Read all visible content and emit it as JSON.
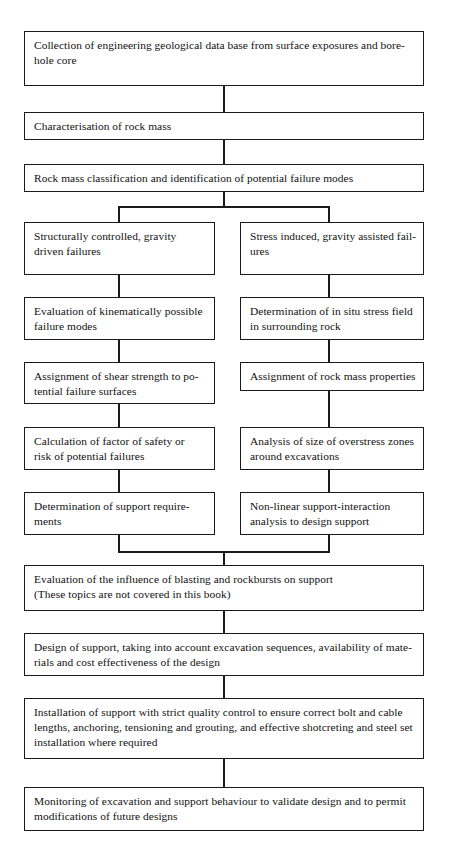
{
  "diagram": {
    "type": "flowchart",
    "orientation": "top-to-bottom",
    "line_color": "#1a1a1a",
    "box_fill": "#ffffff",
    "nodes": [
      {
        "id": "data-collection",
        "name": "data-collection-box",
        "column": "full",
        "lines": [
          "Collection of engineering geological data base from surface exposures and bore-",
          "hole core"
        ]
      },
      {
        "id": "characterisation",
        "name": "rock-mass-characterisation-box",
        "column": "full",
        "lines": [
          "Characterisation of rock mass"
        ]
      },
      {
        "id": "classification",
        "name": "rock-mass-classification-box",
        "column": "full",
        "lines": [
          "Rock mass classification and identification of potential failure modes"
        ]
      },
      {
        "id": "structurally-controlled",
        "name": "structurally-controlled-failures-box",
        "column": "left",
        "lines": [
          "Structurally controlled, gravity",
          "driven failures"
        ]
      },
      {
        "id": "stress-induced",
        "name": "stress-induced-failures-box",
        "column": "right",
        "lines": [
          "Stress induced, gravity assisted fail-",
          "ures"
        ]
      },
      {
        "id": "kinematic-evaluation",
        "name": "kinematic-evaluation-box",
        "column": "left",
        "lines": [
          "Evaluation of kinematically possible",
          "failure modes"
        ]
      },
      {
        "id": "in-situ-stress",
        "name": "in-situ-stress-determination-box",
        "column": "right",
        "lines": [
          "Determination of in situ stress field",
          "in surrounding rock"
        ]
      },
      {
        "id": "shear-strength",
        "name": "shear-strength-assignment-box",
        "column": "left",
        "lines": [
          "Assignment of shear strength to po-",
          "tential failure surfaces"
        ]
      },
      {
        "id": "rock-mass-properties",
        "name": "rock-mass-properties-assignment-box",
        "column": "right",
        "lines": [
          "Assignment of rock mass properties"
        ]
      },
      {
        "id": "factor-of-safety",
        "name": "factor-of-safety-calculation-box",
        "column": "left",
        "lines": [
          "Calculation of factor of safety or",
          "risk of potential failures"
        ]
      },
      {
        "id": "overstress-zones",
        "name": "overstress-zone-analysis-box",
        "column": "right",
        "lines": [
          "Analysis of size of overstress zones",
          "around excavations"
        ]
      },
      {
        "id": "support-requirements",
        "name": "support-requirements-determination-box",
        "column": "left",
        "lines": [
          "Determination of support require-",
          "ments"
        ]
      },
      {
        "id": "non-linear-analysis",
        "name": "non-linear-support-interaction-box",
        "column": "right",
        "lines": [
          "Non-linear support-interaction",
          "analysis to design support"
        ]
      },
      {
        "id": "blasting-rockbursts",
        "name": "blasting-and-rockbursts-evaluation-box",
        "column": "full",
        "lines": [
          "Evaluation of the influence of blasting and rockbursts on support",
          "(These topics are not covered in this book)"
        ]
      },
      {
        "id": "design-of-support",
        "name": "design-of-support-box",
        "column": "full",
        "lines": [
          "Design of support, taking into account excavation sequences, availability of mate-",
          "rials and cost effectiveness of the design"
        ]
      },
      {
        "id": "installation-of-support",
        "name": "installation-of-support-box",
        "column": "full",
        "lines": [
          "Installation of support with strict quality control to ensure correct bolt and cable",
          "lengths, anchoring, tensioning and grouting, and effective shotcreting and steel set",
          "installation where required"
        ]
      },
      {
        "id": "monitoring",
        "name": "monitoring-of-excavation-box",
        "column": "full",
        "lines": [
          "Monitoring of excavation and support behaviour to validate design and to permit",
          "modifications of future designs"
        ]
      }
    ]
  }
}
